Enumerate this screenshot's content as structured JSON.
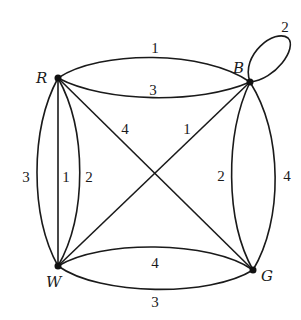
{
  "diagram": {
    "type": "weighted multigraph",
    "line_color": "#1a1a1a",
    "background": "#ffffff",
    "nodes": [
      {
        "id": "R",
        "label": "R"
      },
      {
        "id": "B",
        "label": "B"
      },
      {
        "id": "W",
        "label": "W"
      },
      {
        "id": "G",
        "label": "G"
      }
    ],
    "edges": [
      {
        "from": "R",
        "to": "B",
        "weight": "1",
        "shape": "upper arc"
      },
      {
        "from": "R",
        "to": "B",
        "weight": "3",
        "shape": "lower arc"
      },
      {
        "from": "B",
        "to": "B",
        "weight": "2",
        "shape": "loop"
      },
      {
        "from": "R",
        "to": "W",
        "weight": "3",
        "shape": "outer arc"
      },
      {
        "from": "R",
        "to": "W",
        "weight": "1",
        "shape": "straight"
      },
      {
        "from": "R",
        "to": "W",
        "weight": "2",
        "shape": "inner arc"
      },
      {
        "from": "R",
        "to": "G",
        "weight": "4",
        "shape": "straight diagonal"
      },
      {
        "from": "W",
        "to": "B",
        "weight": "1",
        "shape": "straight diagonal"
      },
      {
        "from": "B",
        "to": "G",
        "weight": "2",
        "shape": "inner arc"
      },
      {
        "from": "B",
        "to": "G",
        "weight": "4",
        "shape": "outer arc"
      },
      {
        "from": "W",
        "to": "G",
        "weight": "4",
        "shape": "upper arc"
      },
      {
        "from": "W",
        "to": "G",
        "weight": "3",
        "shape": "lower arc"
      }
    ]
  }
}
